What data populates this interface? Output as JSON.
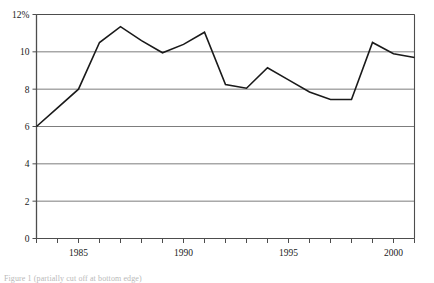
{
  "chart_data": {
    "type": "line",
    "title": "",
    "xlabel": "",
    "ylabel": "",
    "x": [
      1983,
      1984,
      1985,
      1986,
      1987,
      1988,
      1989,
      1990,
      1991,
      1992,
      1993,
      1994,
      1995,
      1996,
      1997,
      1998,
      1999,
      2000,
      2001
    ],
    "values": [
      6.0,
      7.0,
      8.0,
      10.5,
      11.35,
      10.6,
      9.95,
      10.4,
      11.05,
      8.25,
      8.05,
      9.15,
      8.5,
      7.85,
      7.45,
      7.45,
      10.5,
      9.9,
      9.7
    ],
    "series": [
      {
        "name": "rate",
        "values": [
          6.0,
          7.0,
          8.0,
          10.5,
          11.35,
          10.6,
          9.95,
          10.4,
          11.05,
          8.25,
          8.05,
          9.15,
          8.5,
          7.85,
          7.45,
          7.45,
          10.5,
          9.9,
          9.7
        ]
      }
    ],
    "ylim": [
      0,
      12
    ],
    "xlim": [
      1983,
      2001
    ],
    "y_ticks": [
      0,
      2,
      4,
      6,
      8,
      10,
      12
    ],
    "y_tick_labels": [
      "0",
      "2",
      "4",
      "6",
      "8",
      "10",
      "12%"
    ],
    "x_ticks": [
      1983,
      1984,
      1985,
      1986,
      1987,
      1988,
      1989,
      1990,
      1991,
      1992,
      1993,
      1994,
      1995,
      1996,
      1997,
      1998,
      1999,
      2000,
      2001
    ],
    "x_tick_labels": [
      "",
      "",
      "1985",
      "",
      "",
      "",
      "",
      "1990",
      "",
      "",
      "",
      "",
      "1995",
      "",
      "",
      "",
      "",
      "2000",
      ""
    ],
    "grid": true,
    "grid_axis": "y",
    "legend": null,
    "line_color": "#1a1a1a",
    "grid_color": "#7d7d7d",
    "axis_color": "#4d4d4d",
    "background": "#ffffff"
  },
  "caption": {
    "text": "Figure 1 (partially cut off at bottom edge)"
  }
}
